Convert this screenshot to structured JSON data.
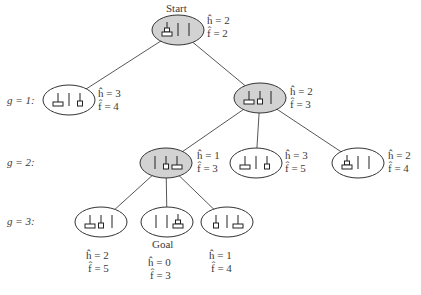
{
  "title_labels": {
    "start": "Start",
    "goal": "Goal"
  },
  "levels": [
    {
      "label": "g = 1:"
    },
    {
      "label": "g = 2:"
    },
    {
      "label": "g = 3:"
    }
  ],
  "colors": {
    "expanded_fill": "#d2d2d2",
    "open_fill": "#ffffff",
    "stroke": "#333333"
  },
  "nodes": [
    {
      "id": "start",
      "level": 0,
      "expanded": true,
      "h": "ĥ = 2",
      "f": "f̂ = 2",
      "state": "blocks-start"
    },
    {
      "id": "g1-left",
      "level": 1,
      "expanded": false,
      "h": "ĥ = 3",
      "f": "f̂ = 4",
      "state": "blocks-a"
    },
    {
      "id": "g1-right",
      "level": 1,
      "expanded": true,
      "h": "ĥ = 2",
      "f": "f̂ = 3",
      "state": "blocks-b"
    },
    {
      "id": "g2-left",
      "level": 2,
      "expanded": true,
      "h": "ĥ = 1",
      "f": "f̂ = 3",
      "state": "blocks-c"
    },
    {
      "id": "g2-mid",
      "level": 2,
      "expanded": false,
      "h": "ĥ = 3",
      "f": "f̂ = 5",
      "state": "blocks-d"
    },
    {
      "id": "g2-right",
      "level": 2,
      "expanded": false,
      "h": "ĥ = 2",
      "f": "f̂ = 4",
      "state": "blocks-e"
    },
    {
      "id": "g3-left",
      "level": 3,
      "expanded": false,
      "h": "ĥ = 2",
      "f": "f̂ = 5",
      "state": "blocks-f"
    },
    {
      "id": "g3-goal",
      "level": 3,
      "expanded": false,
      "h": "ĥ = 0",
      "f": "f̂ = 3",
      "state": "blocks-goal"
    },
    {
      "id": "g3-right",
      "level": 3,
      "expanded": false,
      "h": "ĥ = 1",
      "f": "f̂ = 4",
      "state": "blocks-g"
    }
  ],
  "edges": [
    [
      "start",
      "g1-left"
    ],
    [
      "start",
      "g1-right"
    ],
    [
      "g1-right",
      "g2-left"
    ],
    [
      "g1-right",
      "g2-mid"
    ],
    [
      "g1-right",
      "g2-right"
    ],
    [
      "g2-left",
      "g3-left"
    ],
    [
      "g2-left",
      "g3-goal"
    ],
    [
      "g2-left",
      "g3-right"
    ]
  ]
}
